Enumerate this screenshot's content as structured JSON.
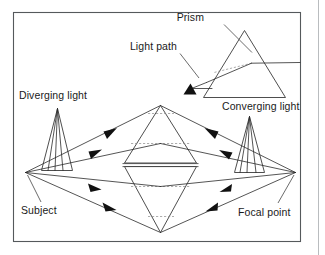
{
  "figure": {
    "background_color": "#ffffff",
    "frame_color": "#55595c",
    "ink_color": "#2a2a2a",
    "width": 325,
    "height": 255
  },
  "labels": {
    "prism": "Prism",
    "light_path": "Light path",
    "diverging_light": "Diverging light",
    "converging_light": "Converging light",
    "subject": "Subject",
    "focal_point": "Focal point"
  },
  "elements": {
    "lens_name": "biconical-lens",
    "prism_name": "triangular-prism",
    "subject_point_name": "subject-vertex",
    "focal_point_name": "focal-vertex",
    "ray_count": 8,
    "arrowhead_count": 9
  }
}
